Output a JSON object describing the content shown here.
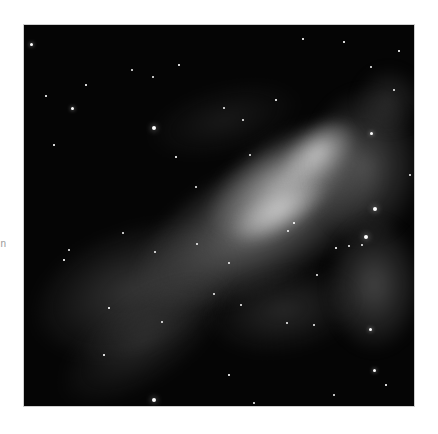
{
  "image": {
    "subject": "grayscale nebula astrophotograph with bright central gas cloud and scattered stars",
    "background_color": "#ffffff",
    "frame": {
      "x": 24,
      "y": 25,
      "width": 390,
      "height": 381
    }
  },
  "edge_text": "n",
  "clouds": [
    {
      "x": 95,
      "y": 135,
      "w": 280,
      "h": 130,
      "rot": -28,
      "c": "rgba(200,200,200,0.55)"
    },
    {
      "x": 170,
      "y": 110,
      "w": 180,
      "h": 90,
      "rot": -32,
      "c": "rgba(235,235,235,0.6)"
    },
    {
      "x": 250,
      "y": 100,
      "w": 90,
      "h": 55,
      "rot": -40,
      "c": "rgba(250,250,250,0.7)"
    },
    {
      "x": 200,
      "y": 160,
      "w": 110,
      "h": 50,
      "rot": -30,
      "c": "rgba(245,245,245,0.6)"
    },
    {
      "x": 280,
      "y": 60,
      "w": 120,
      "h": 160,
      "rot": 0,
      "c": "rgba(140,140,140,0.5)"
    },
    {
      "x": 300,
      "y": 190,
      "w": 100,
      "h": 140,
      "rot": 0,
      "c": "rgba(130,130,130,0.5)"
    },
    {
      "x": 0,
      "y": 200,
      "w": 220,
      "h": 130,
      "rot": -20,
      "c": "rgba(110,110,110,0.45)"
    },
    {
      "x": 20,
      "y": 270,
      "w": 200,
      "h": 90,
      "rot": -35,
      "c": "rgba(90,90,90,0.4)"
    },
    {
      "x": 180,
      "y": 240,
      "w": 160,
      "h": 90,
      "rot": -10,
      "c": "rgba(80,80,80,0.45)"
    },
    {
      "x": 330,
      "y": 40,
      "w": 70,
      "h": 70,
      "rot": 0,
      "c": "rgba(90,90,90,0.4)"
    },
    {
      "x": 120,
      "y": 60,
      "w": 160,
      "h": 70,
      "rot": -15,
      "c": "rgba(60,60,60,0.35)"
    }
  ],
  "stars": [
    [
      7,
      19,
      3
    ],
    [
      48,
      83,
      3
    ],
    [
      130,
      103,
      4
    ],
    [
      129,
      52,
      2
    ],
    [
      200,
      83,
      2
    ],
    [
      219,
      95,
      2
    ],
    [
      279,
      14,
      1.5
    ],
    [
      320,
      17,
      1.5
    ],
    [
      347,
      42,
      2
    ],
    [
      22,
      71,
      1.5
    ],
    [
      62,
      60,
      1.5
    ],
    [
      152,
      132,
      1.5
    ],
    [
      226,
      130,
      2
    ],
    [
      172,
      162,
      2.5
    ],
    [
      347,
      108,
      3
    ],
    [
      351,
      184,
      4
    ],
    [
      342,
      212,
      4.5
    ],
    [
      338,
      220,
      2
    ],
    [
      325,
      221,
      2
    ],
    [
      312,
      223,
      1.5
    ],
    [
      173,
      219,
      2.5
    ],
    [
      205,
      238,
      2.5
    ],
    [
      99,
      208,
      2.5
    ],
    [
      131,
      227,
      2
    ],
    [
      190,
      269,
      2.5
    ],
    [
      217,
      280,
      2
    ],
    [
      263,
      298,
      2
    ],
    [
      290,
      300,
      2
    ],
    [
      293,
      250,
      2
    ],
    [
      346,
      304,
      3
    ],
    [
      138,
      297,
      2.5
    ],
    [
      130,
      375,
      4
    ],
    [
      350,
      345,
      3
    ],
    [
      310,
      370,
      2
    ],
    [
      45,
      225,
      2
    ],
    [
      40,
      235,
      1.5
    ],
    [
      85,
      283,
      1.5
    ],
    [
      375,
      26,
      1.5
    ],
    [
      386,
      150,
      2
    ],
    [
      370,
      65,
      2
    ],
    [
      252,
      75,
      1.5
    ],
    [
      270,
      198,
      1.5
    ],
    [
      264,
      206,
      2
    ],
    [
      155,
      40,
      1.5
    ],
    [
      108,
      45,
      2
    ],
    [
      30,
      120,
      1.5
    ],
    [
      80,
      330,
      1.5
    ],
    [
      230,
      378,
      2
    ],
    [
      362,
      360,
      1.5
    ],
    [
      205,
      350,
      1.5
    ]
  ]
}
